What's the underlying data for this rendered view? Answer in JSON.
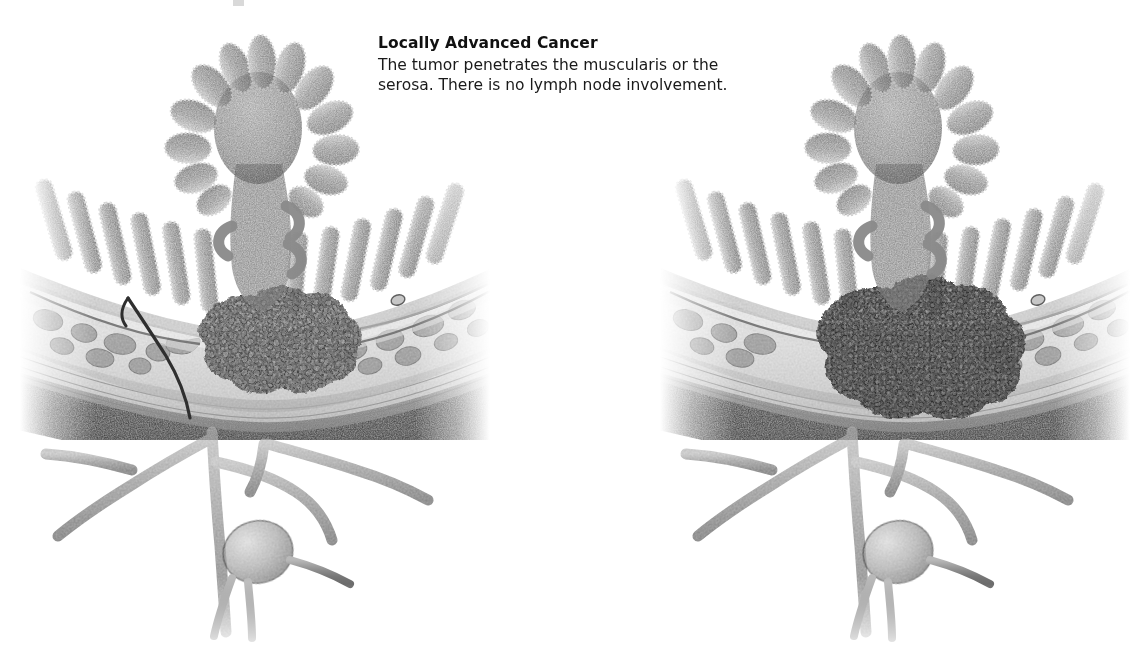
{
  "figure": {
    "kind": "medical-illustration",
    "panel_count": 2,
    "style": "grayscale stipple / airbrush rendering",
    "background_color": "#ffffff"
  },
  "caption": {
    "title": "Locally Advanced Cancer",
    "line1": "The tumor penetrates the muscularis or the",
    "line2": "serosa. There is no lymph node involvement."
  },
  "panels": [
    {
      "id": "left-panel",
      "name": "muscularis-invasion-view",
      "structures": [
        "polypoid tumor head",
        "tumor stalk",
        "intestinal villi",
        "mucosa",
        "submucosa",
        "muscularis propria",
        "serosa",
        "mesenteric blood vessels",
        "lymph node"
      ],
      "lymph_node_involved": false
    },
    {
      "id": "right-panel",
      "name": "serosa-invasion-view",
      "structures": [
        "polypoid tumor head",
        "tumor stalk",
        "intestinal villi",
        "mucosa",
        "submucosa",
        "muscularis propria",
        "serosa",
        "mesenteric blood vessels",
        "lymph node"
      ],
      "lymph_node_involved": false
    }
  ],
  "palette": {
    "ink_black": "#111111",
    "serosa_dark": "#2b2b2b",
    "muscle_mid": "#8d8d8d",
    "tissue_light": "#d6d6d6",
    "tumor_mid": "#8a8a8a",
    "tumor_dark": "#5e5e5e",
    "villi_gray": "#9a9a9a",
    "vessel_gray": "#7c7c7c",
    "paper_white": "#ffffff"
  }
}
